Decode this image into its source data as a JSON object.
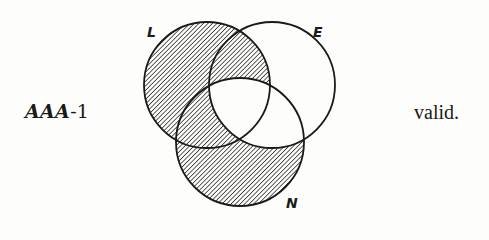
{
  "diagram": {
    "type": "venn-3-set",
    "syllogism": {
      "mood": "AAA",
      "figure": "-1"
    },
    "verdict": "valid.",
    "sets": [
      {
        "id": "L",
        "label": "L",
        "cx": 207,
        "cy": 85,
        "r": 63
      },
      {
        "id": "E",
        "label": "E",
        "cx": 272,
        "cy": 85,
        "r": 63
      },
      {
        "id": "N",
        "label": "N",
        "cx": 240,
        "cy": 142,
        "r": 64
      }
    ],
    "shaded_regions": [
      "L only",
      "L∩E not N",
      "L∩N not E",
      "N only"
    ],
    "unshaded_regions": [
      "E only",
      "E∩N not L",
      "L∩E∩N"
    ],
    "colors": {
      "stroke": "#1a1a1a",
      "hatch": "#2b2b2b",
      "background": "#fdfdfb"
    }
  }
}
